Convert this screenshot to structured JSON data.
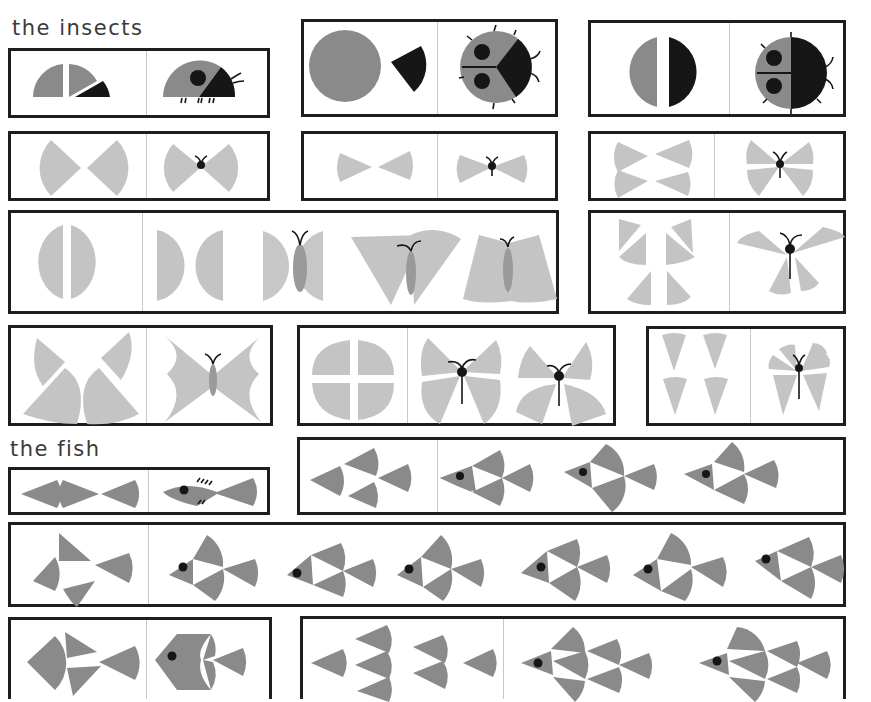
{
  "page": {
    "sections": [
      {
        "id": "insects",
        "title": "the insects"
      },
      {
        "id": "fish",
        "title": "the fish"
      }
    ]
  },
  "colors": {
    "gray_dark": "#8a8a8a",
    "gray_light": "#c4c4c4",
    "black": "#161616",
    "frame": "#1e1e1e",
    "divider": "#c8c8c8",
    "background": "#ffffff"
  },
  "panels": [
    {
      "name": "ladybug-side-panel",
      "section": "insects",
      "parts": "2 gray quarter segments + 1 black segment",
      "result": "side-view ladybug"
    },
    {
      "name": "ladybug-top-panel-1",
      "section": "insects",
      "parts": "gray circle + black wedge",
      "result": "top-view ladybug with spots"
    },
    {
      "name": "ladybug-top-panel-2",
      "section": "insects",
      "parts": "gray half-circle + black half-circle",
      "result": "top-view ladybug split"
    },
    {
      "name": "butterfly-2-sector-panel",
      "section": "insects",
      "parts": "2 sectors",
      "result": "small butterfly"
    },
    {
      "name": "butterfly-2-narrow-panel",
      "section": "insects",
      "parts": "2 narrow sectors",
      "result": "narrow butterfly"
    },
    {
      "name": "butterfly-4-sector-panel",
      "section": "insects",
      "parts": "4 sectors",
      "result": "4-wing butterfly"
    },
    {
      "name": "butterfly-halves-panel",
      "section": "insects",
      "parts": "2 half circles",
      "result": "4 butterfly variants"
    },
    {
      "name": "butterfly-6-piece-panel",
      "section": "insects",
      "parts": "6 sectors",
      "result": "butterfly"
    },
    {
      "name": "butterfly-cross-panel",
      "section": "insects",
      "parts": "2 quarter + 2 half segments",
      "result": "large butterfly"
    },
    {
      "name": "butterfly-quarters-panel",
      "section": "insects",
      "parts": "4 quarter circles",
      "result": "2 butterflies"
    },
    {
      "name": "butterfly-triangles-panel",
      "section": "insects",
      "parts": "4 narrow sectors",
      "result": "small butterfly"
    },
    {
      "name": "fish-3-sector-panel",
      "section": "fish",
      "parts": "3 sectors",
      "result": "fish with fins"
    },
    {
      "name": "fish-4-sector-panel",
      "section": "fish",
      "parts": "4 sectors",
      "result": "3 fish variants"
    },
    {
      "name": "fish-4-scatter-panel",
      "section": "fish",
      "parts": "4 sectors",
      "result": "6 fish variants"
    },
    {
      "name": "fish-4-round-panel",
      "section": "fish",
      "parts": "4 sectors",
      "result": "round fish"
    },
    {
      "name": "fish-7-sector-panel",
      "section": "fish",
      "parts": "7 sectors",
      "result": "2 large fish"
    }
  ]
}
